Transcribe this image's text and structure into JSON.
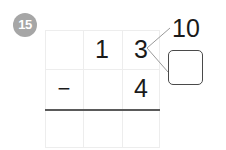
{
  "problem": {
    "number_badge": "15",
    "badge_color": "#a6a6a6",
    "ink_color": "#1a1a1a"
  },
  "grid": {
    "columns": 3,
    "rows": 3,
    "gridline_color": "#ededed",
    "rule_color": "#5a5a5a",
    "rows_data": [
      {
        "name": "minuend",
        "cells": [
          "",
          "1",
          "3"
        ]
      },
      {
        "name": "subtrahend",
        "cells": [
          "−",
          "",
          "4"
        ]
      },
      {
        "name": "difference",
        "cells": [
          "",
          "",
          ""
        ]
      }
    ]
  },
  "decomposition": {
    "source_digit": "3",
    "top_label": "10",
    "bottom_box_value": "",
    "branch_color": "#9a9a9a",
    "box_border_color": "#4a4a4a"
  }
}
